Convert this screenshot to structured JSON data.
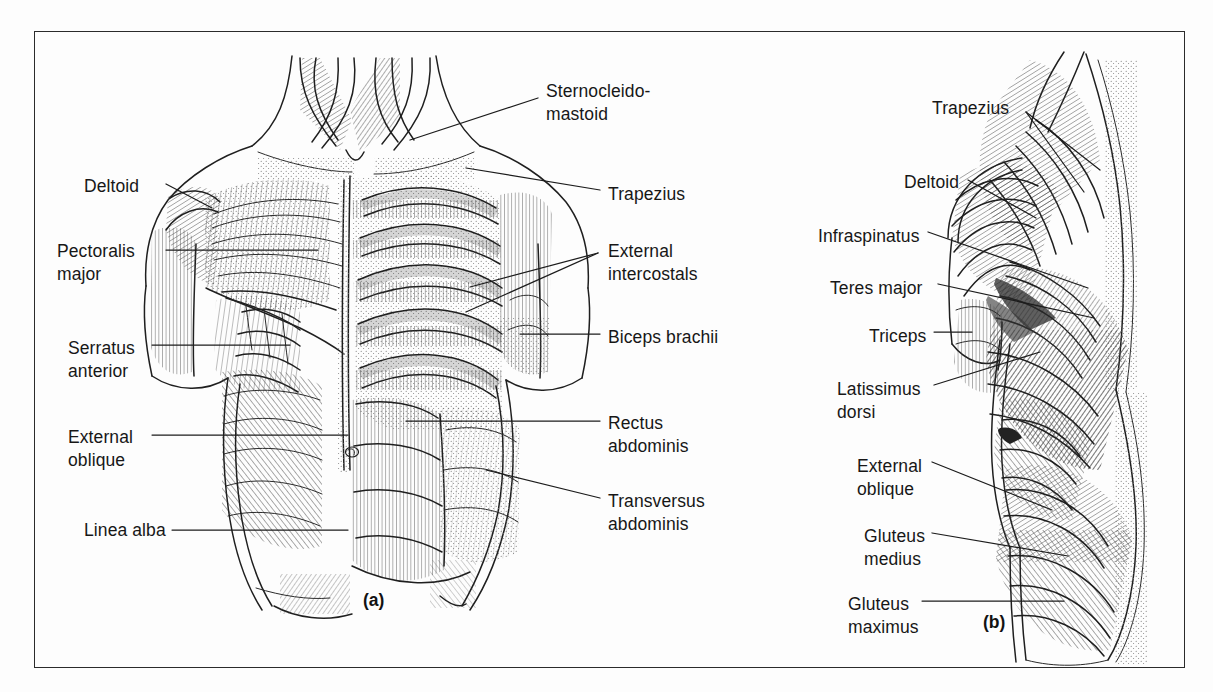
{
  "figure": {
    "background_color": "#fdfdfd",
    "border_color": "#2b2b2b",
    "ink_color": "#1c1c1c",
    "width": 1213,
    "height": 692
  },
  "panels": [
    {
      "id": "a",
      "caption": "(a)",
      "view": "anterior superficial muscles of trunk",
      "labels_left": [
        {
          "name": "deltoid",
          "text": "Deltoid",
          "x": 84,
          "y": 175
        },
        {
          "name": "pectoralis-major",
          "text": "Pectoralis\nmajor",
          "x": 57,
          "y": 240
        },
        {
          "name": "serratus-anterior",
          "text": "Serratus\nanterior",
          "x": 68,
          "y": 337
        },
        {
          "name": "external-oblique",
          "text": "External\noblique",
          "x": 68,
          "y": 426
        },
        {
          "name": "linea-alba",
          "text": "Linea alba",
          "x": 84,
          "y": 519
        }
      ],
      "labels_right": [
        {
          "name": "sternocleidomastoid",
          "text": "Sternocleido-\nmastoid",
          "x": 546,
          "y": 80
        },
        {
          "name": "trapezius",
          "text": "Trapezius",
          "x": 608,
          "y": 183
        },
        {
          "name": "external-intercostals",
          "text": "External\nintercostals",
          "x": 608,
          "y": 240
        },
        {
          "name": "biceps-brachii",
          "text": "Biceps brachii",
          "x": 608,
          "y": 326
        },
        {
          "name": "rectus-abdominis",
          "text": "Rectus\nabdominis",
          "x": 608,
          "y": 412
        },
        {
          "name": "transversus-abdominis",
          "text": "Transversus\nabdominis",
          "x": 608,
          "y": 490
        }
      ],
      "caption_x": 363,
      "caption_y": 590
    },
    {
      "id": "b",
      "caption": "(b)",
      "view": "lateral posterior superficial muscles of trunk",
      "labels_left": [
        {
          "name": "trapezius",
          "text": "Trapezius",
          "x": 932,
          "y": 97
        },
        {
          "name": "deltoid",
          "text": "Deltoid",
          "x": 904,
          "y": 171
        },
        {
          "name": "infraspinatus",
          "text": "Infraspinatus",
          "x": 818,
          "y": 225
        },
        {
          "name": "teres-major",
          "text": "Teres major",
          "x": 830,
          "y": 277
        },
        {
          "name": "triceps",
          "text": "Triceps",
          "x": 869,
          "y": 325
        },
        {
          "name": "latissimus-dorsi",
          "text": "Latissimus\ndorsi",
          "x": 837,
          "y": 378
        },
        {
          "name": "external-oblique",
          "text": "External\noblique",
          "x": 857,
          "y": 455
        },
        {
          "name": "gluteus-medius",
          "text": "Gluteus\nmedius",
          "x": 864,
          "y": 525
        },
        {
          "name": "gluteus-maximus",
          "text": "Gluteus\nmaximus",
          "x": 848,
          "y": 593
        }
      ],
      "labels_right": [],
      "caption_x": 983,
      "caption_y": 612
    }
  ],
  "all_muscle_names": [
    "Sternocleidomastoid",
    "Trapezius",
    "Deltoid",
    "Pectoralis major",
    "External intercostals",
    "Biceps brachii",
    "Serratus anterior",
    "Rectus abdominis",
    "External oblique",
    "Transversus abdominis",
    "Linea alba",
    "Infraspinatus",
    "Teres major",
    "Triceps",
    "Latissimus dorsi",
    "Gluteus medius",
    "Gluteus maximus"
  ]
}
